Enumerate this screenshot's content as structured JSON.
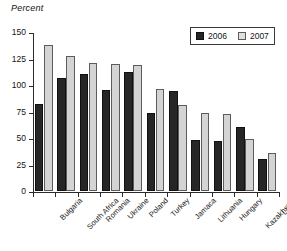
{
  "chart_data": {
    "type": "bar",
    "title": "",
    "subtitle": "",
    "xlabel": "",
    "ylabel": "Percent",
    "ylim": [
      0,
      150
    ],
    "yticks": [
      0,
      25,
      50,
      75,
      100,
      125,
      150
    ],
    "ytick_labels": [
      "0",
      "25",
      "50",
      "75",
      "100",
      "125",
      "150"
    ],
    "grid": false,
    "legend_position": "top-right",
    "categories": [
      "Bulgaria",
      "South Africa",
      "Romania",
      "Ukraine",
      "Poland",
      "Turkey",
      "Jamaca",
      "Lithuania",
      "Hungary",
      "Kazakhstan",
      "Latvia"
    ],
    "series": [
      {
        "name": "2006",
        "color": "#262626",
        "values": [
          82,
          107,
          110,
          95,
          112,
          74,
          94,
          48,
          47,
          60,
          30
        ]
      },
      {
        "name": "2007",
        "color": "#d4d4d4",
        "values": [
          138,
          127,
          121,
          120,
          119,
          96,
          81,
          74,
          73,
          49,
          36
        ]
      }
    ]
  },
  "legend": {
    "items": [
      {
        "label": "2006"
      },
      {
        "label": "2007"
      }
    ]
  },
  "axis": {
    "y_title": "Percent"
  }
}
